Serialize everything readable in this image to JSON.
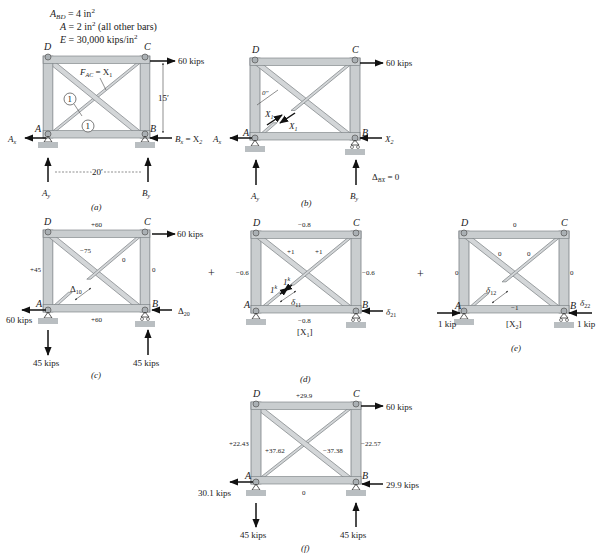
{
  "properties": {
    "line1": "A",
    "line1_sub": "BD",
    "line1_rest": " = 4 in",
    "line1_sup": "2",
    "line2": "A = 2 in",
    "line2_sup": "2",
    "line2_rest": " (all other bars)",
    "line3": "E = 30,000 kips/in",
    "line3_sup": "2"
  },
  "joints": {
    "A": "A",
    "B": "B",
    "C": "C",
    "D": "D"
  },
  "panels": {
    "a": {
      "caption": "(a)",
      "load": "60 kips",
      "member_label": "F",
      "member_label_sub": "AC",
      "member_label_rest": " = X",
      "member_label_sub2": "1",
      "circle1": "1",
      "circle2": "1",
      "height_dim": "15′",
      "width_dim": "20′",
      "Ax": "A",
      "Ax_sub": "x",
      "Bx": "B",
      "Bx_sub": "x",
      "Bx_rest": " = X",
      "Bx_sub2": "2",
      "Ay": "A",
      "Ay_sub": "y",
      "By": "B",
      "By_sub": "y"
    },
    "b": {
      "caption": "(b)",
      "load": "60 kips",
      "gap": "0″",
      "X1a": "X",
      "X1a_sub": "1",
      "X1b": "X",
      "X1b_sub": "1",
      "Ax": "A",
      "Ax_sub": "x",
      "X2": "X",
      "X2_sub": "2",
      "Ay": "A",
      "Ay_sub": "y",
      "By": "B",
      "By_sub": "y",
      "delta": "Δ",
      "delta_sub": "BX",
      "delta_rest": " = 0"
    },
    "c": {
      "caption": "(c)",
      "load": "60 kips",
      "forces": {
        "DC": "+60",
        "AB": "+60",
        "AD": "+45",
        "BC": "0",
        "BD": "−75",
        "AC": "0"
      },
      "delta10": "Δ",
      "delta10_sub": "10",
      "delta20": "Δ",
      "delta20_sub": "20",
      "reaction_Ax": "60 kips",
      "reaction_Ay": "45 kips",
      "reaction_By": "45 kips"
    },
    "d": {
      "caption": "(d)",
      "label": "[X",
      "label_sub": "1",
      "label_end": "]",
      "forces": {
        "DC": "−0.8",
        "AB": "−0.8",
        "AD": "−0.6",
        "BC": "−0.6",
        "BD": "+1",
        "AC": "+1"
      },
      "unit1": "1",
      "unit1_sup": "k",
      "unit2": "1",
      "unit2_sup": "k",
      "delta11": "δ",
      "delta11_sub": "11",
      "delta21": "δ",
      "delta21_sub": "21"
    },
    "e": {
      "caption": "(e)",
      "label": "[X",
      "label_sub": "2",
      "label_end": "]",
      "forces": {
        "DC": "0",
        "AB": "−1",
        "AD": "0",
        "BC": "0",
        "BD": "0",
        "AC": "0"
      },
      "delta12": "δ",
      "delta12_sub": "12",
      "delta22": "δ",
      "delta22_sub": "22",
      "load_A": "1 kip",
      "load_B": "1 kip"
    },
    "f": {
      "caption": "(f)",
      "load": "60 kips",
      "forces": {
        "DC": "+29.9",
        "AB": "0",
        "AD": "+22.43",
        "BC": "−22.57",
        "AC": "+37.62",
        "BD": "−37.38"
      },
      "reaction_Ax": "30.1 kips",
      "reaction_Bx": "29.9 kips",
      "reaction_Ay": "45 kips",
      "reaction_By": "45 kips"
    }
  },
  "operators": {
    "plus1": "+",
    "plus2": "+"
  }
}
